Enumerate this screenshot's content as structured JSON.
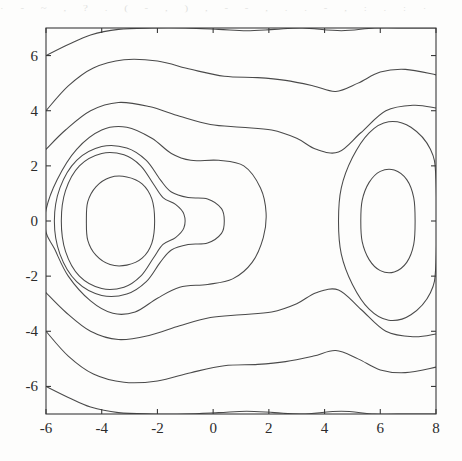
{
  "figure": {
    "kind": "contour-plot",
    "background_color": "#fdfdfc",
    "line_color": "#4a4a4a",
    "axis_color": "#3a3a3a",
    "title": "",
    "scan_artifact_text": "· - ~ , ? . ( - , ) , - - , . . - , : . : ·"
  },
  "chart_data": {
    "type": "line",
    "subtype": "contour",
    "title": "",
    "xlabel": "",
    "ylabel": "",
    "xlim": [
      -6,
      8
    ],
    "ylim": [
      -7,
      7
    ],
    "grid": false,
    "legend": "none",
    "xticks": [
      -6,
      -4,
      -2,
      0,
      2,
      4,
      6,
      8
    ],
    "xticklabels": [
      "-6",
      "-4",
      "-2",
      "0",
      "2",
      "4",
      "6",
      "8"
    ],
    "yticks": [
      -6,
      -4,
      -2,
      0,
      2,
      4,
      6
    ],
    "yticklabels": [
      "-6",
      "-4",
      "-2",
      "0",
      "2",
      "4",
      "6"
    ],
    "tick_direction": "in",
    "n_contour_levels": 11,
    "features": [
      {
        "name": "left-peak-center",
        "x": -3.0,
        "y": 0.0,
        "closed_rings": 4
      },
      {
        "name": "right-peak-center",
        "x": 6.2,
        "y": 0.0,
        "closed_rings": 2
      },
      {
        "name": "saddle-between-peaks",
        "x": 1.4,
        "y": 0.0
      },
      {
        "name": "nose-extension",
        "x": -0.7,
        "y": 0.0
      }
    ],
    "series": [
      {
        "name": "level-1-outer-top",
        "points": [
          [
            -6,
            6.0
          ],
          [
            -5.2,
            6.4
          ],
          [
            -4.4,
            6.75
          ],
          [
            -3.4,
            6.95
          ],
          [
            -2.2,
            7.0
          ],
          [
            -1.0,
            7.0
          ],
          [
            0.2,
            6.95
          ],
          [
            1.2,
            6.9
          ],
          [
            2.2,
            6.95
          ],
          [
            3.2,
            7.0
          ],
          [
            4.6,
            6.9
          ],
          [
            5.8,
            7.0
          ],
          [
            7.0,
            7.0
          ],
          [
            8,
            7.0
          ]
        ]
      },
      {
        "name": "level-1-outer-bottom",
        "points": [
          [
            -6,
            -6.0
          ],
          [
            -5.2,
            -6.4
          ],
          [
            -4.4,
            -6.75
          ],
          [
            -3.4,
            -6.95
          ],
          [
            -2.2,
            -7.0
          ],
          [
            -1.0,
            -7.0
          ],
          [
            0.2,
            -6.95
          ],
          [
            1.2,
            -6.9
          ],
          [
            2.2,
            -6.95
          ],
          [
            3.2,
            -7.0
          ],
          [
            4.6,
            -6.9
          ],
          [
            5.8,
            -7.0
          ],
          [
            7.0,
            -7.0
          ],
          [
            8,
            -7.0
          ]
        ]
      },
      {
        "name": "level-2-top",
        "points": [
          [
            -6,
            4.0
          ],
          [
            -5.2,
            4.9
          ],
          [
            -4.3,
            5.55
          ],
          [
            -3.2,
            5.85
          ],
          [
            -2.0,
            5.8
          ],
          [
            -0.8,
            5.5
          ],
          [
            0.4,
            5.25
          ],
          [
            1.6,
            5.2
          ],
          [
            2.6,
            5.1
          ],
          [
            3.6,
            4.9
          ],
          [
            4.4,
            4.7
          ],
          [
            5.2,
            5.0
          ],
          [
            6.0,
            5.4
          ],
          [
            6.9,
            5.5
          ],
          [
            8,
            5.3
          ]
        ]
      },
      {
        "name": "level-2-bottom",
        "points": [
          [
            -6,
            -4.0
          ],
          [
            -5.2,
            -4.9
          ],
          [
            -4.3,
            -5.55
          ],
          [
            -3.2,
            -5.85
          ],
          [
            -2.0,
            -5.8
          ],
          [
            -0.8,
            -5.5
          ],
          [
            0.4,
            -5.25
          ],
          [
            1.6,
            -5.2
          ],
          [
            2.6,
            -5.1
          ],
          [
            3.6,
            -4.9
          ],
          [
            4.4,
            -4.7
          ],
          [
            5.2,
            -5.0
          ],
          [
            6.0,
            -5.4
          ],
          [
            6.9,
            -5.5
          ],
          [
            8,
            -5.3
          ]
        ]
      },
      {
        "name": "level-3-top",
        "points": [
          [
            -6,
            2.6
          ],
          [
            -5.3,
            3.3
          ],
          [
            -4.4,
            4.0
          ],
          [
            -3.4,
            4.3
          ],
          [
            -2.3,
            4.15
          ],
          [
            -1.2,
            3.8
          ],
          [
            -0.1,
            3.5
          ],
          [
            1.0,
            3.4
          ],
          [
            2.1,
            3.3
          ],
          [
            3.0,
            3.0
          ],
          [
            3.7,
            2.6
          ],
          [
            4.5,
            2.5
          ],
          [
            5.3,
            3.2
          ],
          [
            6.2,
            4.0
          ],
          [
            7.2,
            4.2
          ],
          [
            8,
            4.1
          ]
        ]
      },
      {
        "name": "level-3-bottom",
        "points": [
          [
            -6,
            -2.6
          ],
          [
            -5.3,
            -3.3
          ],
          [
            -4.4,
            -4.0
          ],
          [
            -3.4,
            -4.3
          ],
          [
            -2.3,
            -4.15
          ],
          [
            -1.2,
            -3.8
          ],
          [
            -0.1,
            -3.5
          ],
          [
            1.0,
            -3.4
          ],
          [
            2.1,
            -3.3
          ],
          [
            3.0,
            -3.0
          ],
          [
            3.7,
            -2.6
          ],
          [
            4.5,
            -2.5
          ],
          [
            5.3,
            -3.2
          ],
          [
            6.2,
            -4.0
          ],
          [
            7.2,
            -4.2
          ],
          [
            8,
            -4.1
          ]
        ]
      },
      {
        "name": "level-4-left-lobe-and-saddle",
        "closed": true,
        "points": [
          [
            -6,
            0.4
          ],
          [
            -5.6,
            1.5
          ],
          [
            -4.9,
            2.6
          ],
          [
            -4.0,
            3.3
          ],
          [
            -3.1,
            3.4
          ],
          [
            -2.2,
            3.0
          ],
          [
            -1.5,
            2.45
          ],
          [
            -0.8,
            2.2
          ],
          [
            0.2,
            2.2
          ],
          [
            1.1,
            2.0
          ],
          [
            1.7,
            1.2
          ],
          [
            1.9,
            0.3
          ],
          [
            1.8,
            -0.6
          ],
          [
            1.4,
            -1.5
          ],
          [
            0.7,
            -2.1
          ],
          [
            -0.2,
            -2.3
          ],
          [
            -1.2,
            -2.4
          ],
          [
            -2.0,
            -2.8
          ],
          [
            -2.8,
            -3.3
          ],
          [
            -3.6,
            -3.35
          ],
          [
            -4.4,
            -2.9
          ],
          [
            -5.2,
            -2.0
          ],
          [
            -5.7,
            -1.0
          ],
          [
            -6,
            -0.4
          ]
        ]
      },
      {
        "name": "level-4-right-lobe",
        "closed": true,
        "points": [
          [
            4.5,
            0.0
          ],
          [
            4.6,
            1.2
          ],
          [
            5.0,
            2.3
          ],
          [
            5.6,
            3.2
          ],
          [
            6.3,
            3.6
          ],
          [
            7.1,
            3.4
          ],
          [
            7.8,
            2.6
          ],
          [
            8,
            1.5
          ],
          [
            8,
            -1.5
          ],
          [
            7.8,
            -2.6
          ],
          [
            7.1,
            -3.4
          ],
          [
            6.3,
            -3.6
          ],
          [
            5.6,
            -3.2
          ],
          [
            5.0,
            -2.3
          ],
          [
            4.6,
            -1.2
          ]
        ]
      },
      {
        "name": "level-5-left-with-nose",
        "closed": true,
        "points": [
          [
            -5.7,
            0.0
          ],
          [
            -5.5,
            1.2
          ],
          [
            -4.9,
            2.2
          ],
          [
            -4.0,
            2.7
          ],
          [
            -3.1,
            2.65
          ],
          [
            -2.4,
            2.2
          ],
          [
            -1.9,
            1.5
          ],
          [
            -1.5,
            1.05
          ],
          [
            -0.9,
            0.85
          ],
          [
            -0.2,
            0.8
          ],
          [
            0.3,
            0.45
          ],
          [
            0.4,
            0.0
          ],
          [
            0.3,
            -0.45
          ],
          [
            -0.2,
            -0.8
          ],
          [
            -0.9,
            -0.85
          ],
          [
            -1.5,
            -1.05
          ],
          [
            -1.9,
            -1.5
          ],
          [
            -2.4,
            -2.2
          ],
          [
            -3.1,
            -2.65
          ],
          [
            -4.0,
            -2.7
          ],
          [
            -4.9,
            -2.2
          ],
          [
            -5.5,
            -1.2
          ]
        ]
      },
      {
        "name": "level-6-left",
        "closed": true,
        "points": [
          [
            -5.45,
            0.0
          ],
          [
            -5.3,
            1.1
          ],
          [
            -4.8,
            2.0
          ],
          [
            -4.0,
            2.45
          ],
          [
            -3.2,
            2.4
          ],
          [
            -2.6,
            2.0
          ],
          [
            -2.15,
            1.35
          ],
          [
            -1.8,
            0.85
          ],
          [
            -1.35,
            0.6
          ],
          [
            -1.05,
            0.25
          ],
          [
            -1.05,
            -0.25
          ],
          [
            -1.35,
            -0.6
          ],
          [
            -1.8,
            -0.85
          ],
          [
            -2.15,
            -1.35
          ],
          [
            -2.6,
            -2.0
          ],
          [
            -3.2,
            -2.4
          ],
          [
            -4.0,
            -2.45
          ],
          [
            -4.8,
            -2.0
          ],
          [
            -5.3,
            -1.1
          ]
        ]
      },
      {
        "name": "level-7-left-inner-ellipse",
        "closed": true,
        "points": [
          [
            -4.55,
            0.0
          ],
          [
            -4.5,
            0.7
          ],
          [
            -4.2,
            1.25
          ],
          [
            -3.7,
            1.58
          ],
          [
            -3.1,
            1.6
          ],
          [
            -2.55,
            1.35
          ],
          [
            -2.2,
            0.8
          ],
          [
            -2.1,
            0.0
          ],
          [
            -2.2,
            -0.8
          ],
          [
            -2.55,
            -1.35
          ],
          [
            -3.1,
            -1.6
          ],
          [
            -3.7,
            -1.58
          ],
          [
            -4.2,
            -1.25
          ],
          [
            -4.5,
            -0.7
          ]
        ]
      },
      {
        "name": "level-7-right-inner-ellipse",
        "closed": true,
        "points": [
          [
            5.3,
            0.0
          ],
          [
            5.35,
            0.75
          ],
          [
            5.6,
            1.4
          ],
          [
            6.0,
            1.8
          ],
          [
            6.5,
            1.85
          ],
          [
            6.95,
            1.5
          ],
          [
            7.2,
            0.85
          ],
          [
            7.25,
            0.0
          ],
          [
            7.2,
            -0.85
          ],
          [
            6.95,
            -1.5
          ],
          [
            6.5,
            -1.85
          ],
          [
            6.0,
            -1.8
          ],
          [
            5.6,
            -1.4
          ],
          [
            5.35,
            -0.75
          ]
        ]
      }
    ]
  }
}
